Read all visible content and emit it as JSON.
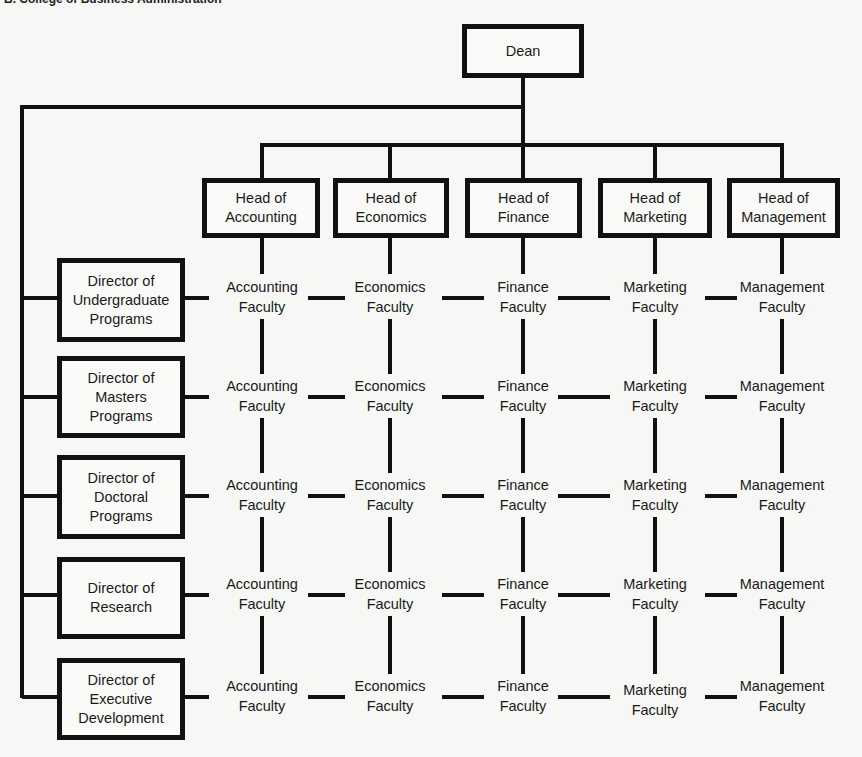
{
  "caption": "B. College of Business Administration",
  "dean": {
    "label": "Dean"
  },
  "heads": [
    {
      "line1": "Head of",
      "line2": "Accounting"
    },
    {
      "line1": "Head of",
      "line2": "Economics"
    },
    {
      "line1": "Head of",
      "line2": "Finance"
    },
    {
      "line1": "Head of",
      "line2": "Marketing"
    },
    {
      "line1": "Head of",
      "line2": "Management"
    }
  ],
  "directors": [
    {
      "lines": [
        "Director of",
        "Undergraduate",
        "Programs"
      ]
    },
    {
      "lines": [
        "Director of",
        "Masters",
        "Programs"
      ]
    },
    {
      "lines": [
        "Director of",
        "Doctoral",
        "Programs"
      ]
    },
    {
      "lines": [
        "Director of",
        "Research"
      ]
    },
    {
      "lines": [
        "Director of",
        "Executive",
        "Development"
      ]
    }
  ],
  "faculty_columns": [
    {
      "line1": "Accounting",
      "line2": "Faculty"
    },
    {
      "line1": "Economics",
      "line2": "Faculty"
    },
    {
      "line1": "Finance",
      "line2": "Faculty"
    },
    {
      "line1": "Marketing",
      "line2": "Faculty"
    },
    {
      "line1": "Management",
      "line2": "Faculty"
    }
  ]
}
